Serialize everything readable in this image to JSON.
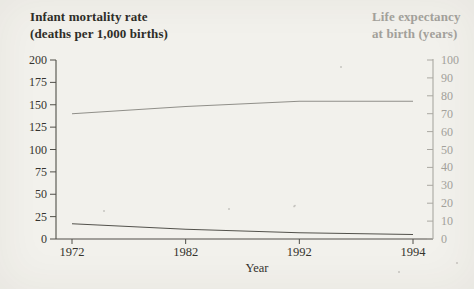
{
  "figure": {
    "background": "#f2f1ec"
  },
  "left_axis": {
    "title_line1": "Infant mortality rate",
    "title_line2": "(deaths per 1,000 births)",
    "ticks": [
      0,
      25,
      50,
      75,
      100,
      125,
      150,
      175,
      200
    ],
    "max": 200,
    "text_color": "#35332e",
    "axis_color": "#504f49"
  },
  "right_axis": {
    "title_line1": "Life expectancy",
    "title_line2": "at birth (years)",
    "ticks": [
      0,
      10,
      20,
      30,
      40,
      50,
      60,
      70,
      80,
      90,
      100
    ],
    "max": 100,
    "text_color": "#a2a09a",
    "axis_color": "#aaa8a2"
  },
  "x_axis": {
    "label": "Year",
    "tick_labels": [
      "1972",
      "1982",
      "1992",
      "1994"
    ]
  },
  "chart_data": {
    "type": "line",
    "x": [
      1972,
      1982,
      1992,
      1994
    ],
    "x_note": "tick marks spaced equally despite unequal year intervals",
    "categories": [
      "1972",
      "1982",
      "1992",
      "1994"
    ],
    "series": [
      {
        "name": "Infant mortality rate (deaths per 1,000 births)",
        "axis": "left",
        "values": [
          17,
          11,
          7,
          5
        ],
        "color": "#53524c"
      },
      {
        "name": "Life expectancy at birth (years)",
        "axis": "right",
        "values": [
          70,
          74,
          77,
          77
        ],
        "color": "#908f89"
      }
    ],
    "left_ylim": [
      0,
      200
    ],
    "right_ylim": [
      0,
      100
    ],
    "xlabel": "Year",
    "grid": false,
    "legend": "none"
  }
}
